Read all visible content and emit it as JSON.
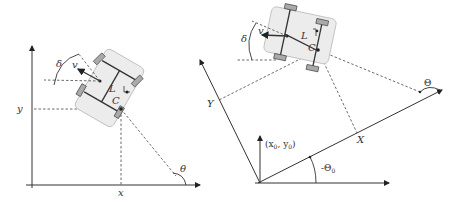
{
  "left_diagram": {
    "labels": {
      "y": "y",
      "x": "x",
      "theta": "θ",
      "delta": "δ",
      "v": "v",
      "L": "L",
      "C": "C"
    }
  },
  "right_diagram": {
    "labels": {
      "Y": "Y",
      "X": "X",
      "Theta": "Θ",
      "delta": "δ",
      "v": "v",
      "L": "L",
      "C": "C",
      "origin": "(x",
      "origin_sub0": "0",
      "origin_mid": ", y",
      "origin_sub1": "0",
      "origin_end": ")",
      "neg_theta0": "-Θ",
      "neg_theta0_sub": "0"
    }
  },
  "colors": {
    "ink": "#333333",
    "car_body": "#ececec",
    "wheel": "#aaaaaa"
  }
}
